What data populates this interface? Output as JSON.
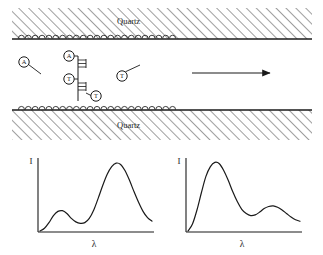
{
  "figure": {
    "title": "",
    "background_color": "#ffffff",
    "stroke_color": "#1a1a1a"
  },
  "channel": {
    "top_wall": {
      "material_label": "Quartz",
      "hatch_pattern": "diagonal-hatch",
      "bead_count": 23,
      "bead_label": "surface-bound-bead"
    },
    "bottom_wall": {
      "material_label": "Quartz",
      "hatch_pattern": "diagonal-hatch",
      "bead_count": 23,
      "bead_label": "surface-bound-bead"
    },
    "flow_arrow": {
      "direction": "right",
      "label": ""
    }
  },
  "molecules": {
    "free_left": {
      "base": "A",
      "has_tail": true
    },
    "free_right": {
      "base": "T",
      "has_tail": true
    },
    "duplex": {
      "description": "base-paired-strand",
      "bases": [
        {
          "base": "A",
          "position": "top-left"
        },
        {
          "base": "T",
          "position": "mid-left"
        },
        {
          "base": "T",
          "position": "bottom-right"
        }
      ],
      "rung_count": 2
    }
  },
  "chart_data": [
    {
      "type": "line",
      "name": "spectrum-left",
      "title": "",
      "xlabel": "λ",
      "ylabel": "I",
      "grid": false,
      "legend": "none",
      "xlim": [
        0,
        1
      ],
      "ylim": [
        0,
        1
      ],
      "x": [
        0.0,
        0.04,
        0.08,
        0.12,
        0.16,
        0.2,
        0.24,
        0.28,
        0.32,
        0.36,
        0.4,
        0.44,
        0.48,
        0.52,
        0.56,
        0.6,
        0.64,
        0.68,
        0.72,
        0.76,
        0.8,
        0.84,
        0.88,
        0.92,
        0.96,
        1.0
      ],
      "values": [
        0.0,
        0.04,
        0.12,
        0.22,
        0.28,
        0.29,
        0.25,
        0.18,
        0.13,
        0.11,
        0.12,
        0.18,
        0.3,
        0.47,
        0.65,
        0.81,
        0.92,
        0.97,
        0.95,
        0.86,
        0.72,
        0.56,
        0.41,
        0.28,
        0.19,
        0.14
      ],
      "peaks": [
        {
          "label": "minor-peak",
          "x": 0.2,
          "y": 0.29
        },
        {
          "label": "major-peak",
          "x": 0.68,
          "y": 0.97
        }
      ]
    },
    {
      "type": "line",
      "name": "spectrum-right",
      "title": "",
      "xlabel": "λ",
      "ylabel": "I",
      "grid": false,
      "legend": "none",
      "xlim": [
        0,
        1
      ],
      "ylim": [
        0,
        1
      ],
      "x": [
        0.0,
        0.04,
        0.08,
        0.12,
        0.16,
        0.2,
        0.24,
        0.28,
        0.32,
        0.36,
        0.4,
        0.44,
        0.48,
        0.52,
        0.56,
        0.6,
        0.64,
        0.68,
        0.72,
        0.76,
        0.8,
        0.84,
        0.88,
        0.92,
        0.96,
        1.0
      ],
      "values": [
        0.0,
        0.1,
        0.3,
        0.55,
        0.78,
        0.92,
        0.98,
        0.96,
        0.86,
        0.72,
        0.56,
        0.42,
        0.31,
        0.25,
        0.22,
        0.23,
        0.27,
        0.32,
        0.35,
        0.36,
        0.34,
        0.3,
        0.25,
        0.2,
        0.16,
        0.14
      ],
      "peaks": [
        {
          "label": "major-peak",
          "x": 0.24,
          "y": 0.98
        },
        {
          "label": "minor-peak",
          "x": 0.76,
          "y": 0.36
        }
      ]
    }
  ]
}
